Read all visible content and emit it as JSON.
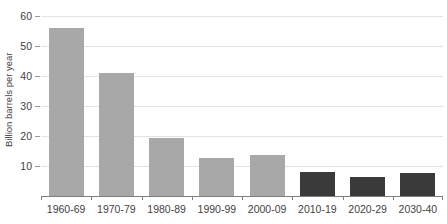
{
  "chart_data": {
    "type": "bar",
    "title": "",
    "xlabel": "",
    "ylabel": "Billion barrels per year",
    "categories": [
      "1960-69",
      "1970-79",
      "1980-89",
      "1990-99",
      "2000-09",
      "2010-19",
      "2020-29",
      "2030-40"
    ],
    "values": [
      56,
      41,
      19.5,
      12.8,
      13.6,
      8,
      6.2,
      7.8
    ],
    "bar_colors": [
      "#a8a8a8",
      "#a8a8a8",
      "#a8a8a8",
      "#a8a8a8",
      "#a8a8a8",
      "#3a3a3a",
      "#3a3a3a",
      "#3a3a3a"
    ],
    "ylim": [
      0,
      60
    ],
    "ytick_values": [
      10,
      20,
      30,
      40,
      50,
      60
    ],
    "ytick_labels": [
      "10",
      "20",
      "30",
      "40",
      "50",
      "60"
    ],
    "grid": true,
    "grid_axis": "y",
    "grid_color": "#e2e2e2",
    "axis_color": "#808080",
    "legend": "none",
    "background": "#ffffff",
    "series": [
      {
        "name": "Billion barrels per year",
        "values": [
          56,
          41,
          19.5,
          12.8,
          13.6,
          8,
          6.2,
          7.8
        ]
      }
    ]
  }
}
